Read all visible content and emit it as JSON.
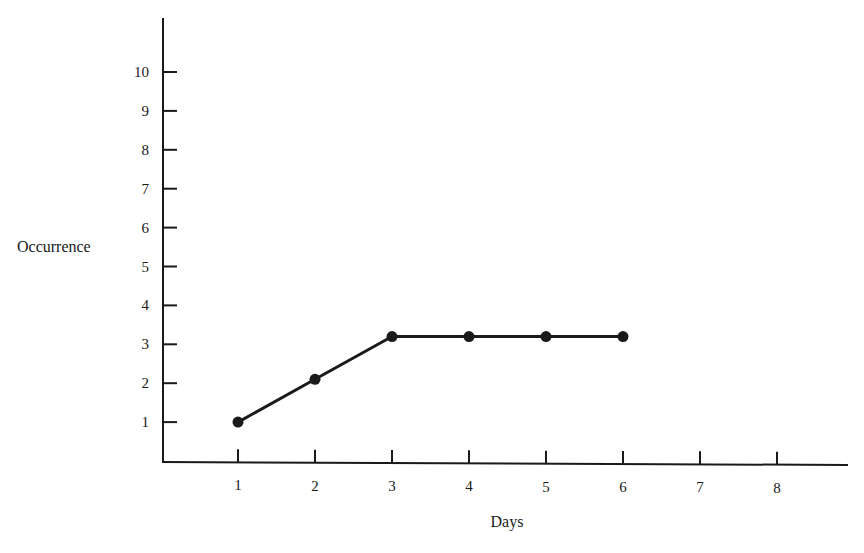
{
  "chart_data": {
    "type": "line",
    "title": "",
    "xlabel": "Days",
    "ylabel": "Occurrence",
    "x": [
      1,
      2,
      3,
      4,
      5,
      6
    ],
    "values": [
      1.0,
      2.1,
      3.2,
      3.2,
      3.2,
      3.2
    ],
    "series": [
      {
        "name": "Occurrence",
        "x": [
          1,
          2,
          3,
          4,
          5,
          6
        ],
        "values": [
          1.0,
          2.1,
          3.2,
          3.2,
          3.2,
          3.2
        ]
      }
    ],
    "x_ticks": [
      1,
      2,
      3,
      4,
      5,
      6,
      7,
      8
    ],
    "y_ticks": [
      1,
      2,
      3,
      4,
      5,
      6,
      7,
      8,
      9,
      10
    ],
    "xlim": [
      0,
      9
    ],
    "ylim": [
      0,
      11
    ],
    "grid": false,
    "legend": null,
    "markers": "filled-circle",
    "line_color": "#1a1a1a"
  }
}
